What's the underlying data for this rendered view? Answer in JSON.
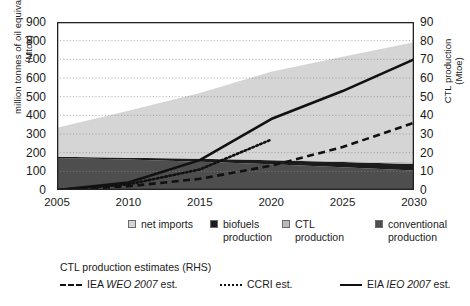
{
  "chart_data": {
    "type": "area",
    "title": "",
    "subtitle": "",
    "xlabel": "",
    "ylabel": "million tonnes of oil equivalent (Mtoe)",
    "ylabel_right": "CTL production (Mtoe)",
    "x": [
      2005,
      2010,
      2015,
      2020,
      2025,
      2030
    ],
    "xlim": [
      2005,
      2030
    ],
    "ylim": [
      0,
      900
    ],
    "ylim_right": [
      0,
      90
    ],
    "yticks": [
      0,
      100,
      200,
      300,
      400,
      500,
      600,
      700,
      800,
      900
    ],
    "yticks_right": [
      0,
      10,
      20,
      30,
      40,
      50,
      60,
      70,
      80,
      90
    ],
    "xticks": [
      2005,
      2010,
      2015,
      2020,
      2025,
      2030
    ],
    "grid": "horizontal-dotted",
    "legend_position": "below-axis",
    "stacked_series": [
      {
        "name": "conventional production",
        "color": "#4e4e4e",
        "axis": "left",
        "values": [
          172,
          163,
          152,
          138,
          122,
          105
        ]
      },
      {
        "name": "biofuels production",
        "color": "#1c1c1c",
        "axis": "left",
        "values": [
          6,
          10,
          16,
          22,
          28,
          34
        ]
      },
      {
        "name": "CTL production",
        "color": "#b9b9b9",
        "axis": "left",
        "values": [
          0,
          0,
          1,
          3,
          6,
          9
        ]
      },
      {
        "name": "net imports",
        "color": "#d5d5d5",
        "axis": "left",
        "values": [
          155,
          252,
          350,
          470,
          558,
          643
        ]
      }
    ],
    "stack_top": [
      333,
      425,
      519,
      633,
      714,
      791
    ],
    "line_series": [
      {
        "name": "IEA WEO 2007 est.",
        "style": "dashed",
        "color": "#111111",
        "axis": "right",
        "x": [
          2005,
          2010,
          2015,
          2020,
          2025,
          2030
        ],
        "values": [
          0,
          2,
          6,
          13,
          23,
          36
        ]
      },
      {
        "name": "CCRI est.",
        "style": "dotted",
        "color": "#111111",
        "axis": "right",
        "x": [
          2005,
          2010,
          2015,
          2020
        ],
        "values": [
          0,
          3,
          11,
          27
        ]
      },
      {
        "name": "EIA IEO 2007 est.",
        "style": "solid",
        "color": "#111111",
        "axis": "right",
        "x": [
          2005,
          2010,
          2015,
          2020,
          2025,
          2030
        ],
        "values": [
          0,
          4,
          16,
          38,
          53,
          70
        ]
      }
    ]
  },
  "axes": {
    "left_title": "million tonnes of oil equivalent\n(Mtoe)",
    "right_title": "CTL production\n(Mtoe)",
    "y_left_ticks": [
      "900",
      "800",
      "700",
      "600",
      "500",
      "400",
      "300",
      "200",
      "100",
      "0"
    ],
    "y_right_ticks": [
      "90",
      "80",
      "70",
      "60",
      "50",
      "40",
      "30",
      "20",
      "10",
      "0"
    ],
    "x_ticks": [
      "2005",
      "2010",
      "2015",
      "2020",
      "2025",
      "2030"
    ]
  },
  "legend": {
    "items": [
      {
        "label": "net imports",
        "color": "#d5d5d5"
      },
      {
        "label": "biofuels\nproduction",
        "color": "#1c1c1c"
      },
      {
        "label": "CTL\nproduction",
        "color": "#b9b9b9"
      },
      {
        "label": "conventional\nproduction",
        "color": "#4e4e4e"
      }
    ]
  },
  "legend2": {
    "title": "CTL production estimates (RHS)",
    "items": [
      {
        "prefix": "IEA ",
        "emphasis": "WEO 2007",
        "suffix": " est.",
        "style": "dashed"
      },
      {
        "prefix": "",
        "emphasis": "",
        "suffix": "CCRI est.",
        "style": "dotted"
      },
      {
        "prefix": "EIA ",
        "emphasis": "IEO 2007",
        "suffix": " est.",
        "style": "solid"
      }
    ]
  }
}
